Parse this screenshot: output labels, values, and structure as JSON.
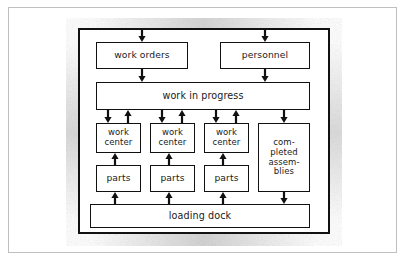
{
  "diagram": {
    "style": "hand-drawn scanned block diagram",
    "colors": {
      "ink": "#111111",
      "paper": "#ffffff",
      "scan_border": "#bfbfbf",
      "smudge": "#787878"
    },
    "nodes": [
      {
        "id": "work_orders",
        "label": "work orders",
        "lines": [
          "work orders"
        ]
      },
      {
        "id": "personnel",
        "label": "personnel",
        "lines": [
          "personnel"
        ]
      },
      {
        "id": "work_in_progress",
        "label": "work in progress",
        "lines": [
          "work in progress"
        ]
      },
      {
        "id": "work_center_1",
        "label": "work center",
        "lines": [
          "work",
          "center"
        ]
      },
      {
        "id": "work_center_2",
        "label": "work center",
        "lines": [
          "work",
          "center"
        ]
      },
      {
        "id": "work_center_3",
        "label": "work center",
        "lines": [
          "work",
          "center"
        ]
      },
      {
        "id": "completed_assemblies",
        "label": "completed assemblies",
        "lines": [
          "com-",
          "pleted",
          "assem-",
          "blies"
        ]
      },
      {
        "id": "parts_1",
        "label": "parts",
        "lines": [
          "parts"
        ]
      },
      {
        "id": "parts_2",
        "label": "parts",
        "lines": [
          "parts"
        ]
      },
      {
        "id": "parts_3",
        "label": "parts",
        "lines": [
          "parts"
        ]
      },
      {
        "id": "loading_dock",
        "label": "loading dock",
        "lines": [
          "loading dock"
        ]
      }
    ],
    "edges": [
      {
        "from": "outside",
        "to": "work_orders",
        "direction": "down"
      },
      {
        "from": "outside",
        "to": "personnel",
        "direction": "down"
      },
      {
        "from": "work_orders",
        "to": "work_in_progress",
        "direction": "down"
      },
      {
        "from": "personnel",
        "to": "work_in_progress",
        "direction": "down"
      },
      {
        "from": "work_in_progress",
        "to": "work_center_1",
        "direction": "down"
      },
      {
        "from": "work_center_1",
        "to": "work_in_progress",
        "direction": "up"
      },
      {
        "from": "work_in_progress",
        "to": "work_center_2",
        "direction": "down"
      },
      {
        "from": "work_center_2",
        "to": "work_in_progress",
        "direction": "up"
      },
      {
        "from": "work_in_progress",
        "to": "work_center_3",
        "direction": "down"
      },
      {
        "from": "work_center_3",
        "to": "work_in_progress",
        "direction": "up"
      },
      {
        "from": "work_in_progress",
        "to": "completed_assemblies",
        "direction": "down"
      },
      {
        "from": "parts_1",
        "to": "work_center_1",
        "direction": "up"
      },
      {
        "from": "parts_2",
        "to": "work_center_2",
        "direction": "up"
      },
      {
        "from": "parts_3",
        "to": "work_center_3",
        "direction": "up"
      },
      {
        "from": "loading_dock",
        "to": "parts_1",
        "direction": "up"
      },
      {
        "from": "loading_dock",
        "to": "parts_2",
        "direction": "up"
      },
      {
        "from": "loading_dock",
        "to": "parts_3",
        "direction": "up"
      },
      {
        "from": "completed_assemblies",
        "to": "loading_dock",
        "direction": "down"
      }
    ],
    "labels": {
      "work_orders": "work orders",
      "personnel": "personnel",
      "work_in_progress": "work in progress",
      "work_center": "work center",
      "work_center_l1": "work",
      "work_center_l2": "center",
      "completed_l1": "com-",
      "completed_l2": "pleted",
      "completed_l3": "assem-",
      "completed_l4": "blies",
      "parts": "parts",
      "loading_dock": "loading dock"
    }
  }
}
